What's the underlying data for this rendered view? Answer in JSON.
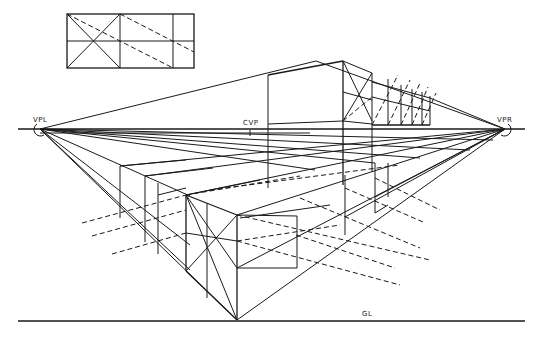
{
  "diagram": {
    "type": "two-point-perspective-construction",
    "labels": {
      "vanishing_point_left": "VPL",
      "vanishing_point_right": "VPR",
      "center_vision_point": "CVP",
      "ground_line": "GL"
    },
    "points": {
      "vpl": [
        40,
        129
      ],
      "vpr": [
        505,
        129
      ],
      "cvp": [
        250,
        129
      ],
      "front_corner": [
        237,
        320
      ]
    },
    "lines": {
      "horizon_y": 129,
      "ground_line_y": 321,
      "x_start": 18,
      "x_end": 525
    },
    "inset": {
      "description": "Rectangle divided into 3x2 grid with diagonals used for measuring",
      "x": 67,
      "y": 14,
      "width": 127,
      "height": 54,
      "columns": 3,
      "rows": 2
    },
    "colors": {
      "line": "#1a1a1a",
      "background": "#ffffff"
    }
  }
}
